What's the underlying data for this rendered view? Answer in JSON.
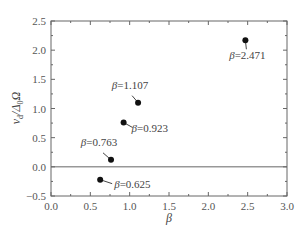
{
  "chart_data": {
    "type": "scatter",
    "title": "",
    "xlabel": "β",
    "ylabel": "v_d/Δ_0Ω",
    "xlim": [
      0.0,
      3.0
    ],
    "ylim": [
      -0.5,
      2.5
    ],
    "xticks": [
      "0.0",
      "0.5",
      "1.0",
      "1.5",
      "2.0",
      "2.5",
      "3.0"
    ],
    "yticks": [
      "-0.5",
      "0.0",
      "0.5",
      "1.0",
      "1.5",
      "2.0",
      "2.5"
    ],
    "grid": false,
    "legend": null,
    "reference_line": {
      "y": 0.0
    },
    "points": [
      {
        "x": 0.625,
        "y": -0.22,
        "label": "β=0.625"
      },
      {
        "x": 0.763,
        "y": 0.12,
        "label": "β=0.763"
      },
      {
        "x": 0.923,
        "y": 0.76,
        "label": "β=0.923"
      },
      {
        "x": 1.107,
        "y": 1.1,
        "label": "β=1.107"
      },
      {
        "x": 2.471,
        "y": 2.17,
        "label": "β=2.471"
      }
    ]
  }
}
